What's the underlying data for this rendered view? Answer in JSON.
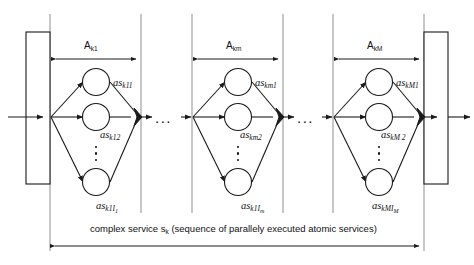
{
  "figure": {
    "type": "workflow-diagram",
    "caption": {
      "prefix": "complex service s",
      "sub": "k",
      "suffix": " (sequence of parallely executed atomic services)",
      "full_text": "complex service s_k (sequence of parallely executed atomic services)"
    },
    "groups": [
      {
        "id": "group-1",
        "span_label": {
          "base": "A",
          "sub": "k1",
          "text": "A_k1"
        },
        "nodes": [
          {
            "id": "node-1-1",
            "base": "as",
            "sub": "k11",
            "text": "as_k11"
          },
          {
            "id": "node-1-2",
            "base": "as",
            "sub": "k12",
            "text": "as_k12"
          },
          {
            "id": "node-1-3",
            "base": "as",
            "sub": "k1I",
            "sub2": "1",
            "text": "as_k1I_1"
          }
        ],
        "vertical_ellipsis": true
      },
      {
        "id": "group-m",
        "span_label": {
          "base": "A",
          "sub": "km",
          "text": "A_km"
        },
        "nodes": [
          {
            "id": "node-m-1",
            "base": "as",
            "sub": "km1",
            "text": "as_km1"
          },
          {
            "id": "node-m-2",
            "base": "as",
            "sub": "km2",
            "text": "as_km2"
          },
          {
            "id": "node-m-3",
            "base": "as",
            "sub": "k1I",
            "sub2": "m",
            "text": "as_k1I_m"
          }
        ],
        "vertical_ellipsis": true
      },
      {
        "id": "group-M",
        "span_label": {
          "base": "A",
          "sub": "kM",
          "text": "A_kM"
        },
        "nodes": [
          {
            "id": "node-M-1",
            "base": "as",
            "sub": "kM1",
            "text": "as_kM1"
          },
          {
            "id": "node-M-2",
            "base": "as",
            "sub": "kM 2",
            "text": "as_kM 2"
          },
          {
            "id": "node-M-3",
            "base": "as",
            "sub": "kMI",
            "sub2": "M",
            "text": "as_kMI_M"
          }
        ],
        "vertical_ellipsis": true
      }
    ],
    "horizontal_ellipses": [
      "...",
      "..."
    ],
    "bars": [
      {
        "id": "start-bar",
        "role": "start-activity-bar"
      },
      {
        "id": "end-bar",
        "role": "end-activity-bar"
      }
    ],
    "colors": {
      "stroke": "#1a1a1a",
      "node_fill": "#ffffff",
      "merge_fill": "#1a1a1a",
      "guide_line": "#8c8c8c",
      "background": "#ffffff"
    }
  }
}
